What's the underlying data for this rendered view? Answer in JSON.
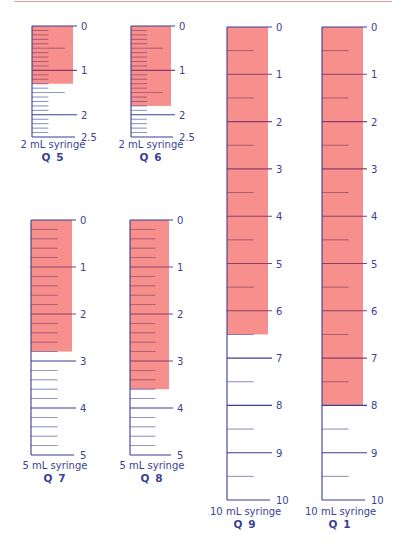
{
  "colors": {
    "scale_line": "#3a3f93",
    "fill": "#f7908d",
    "fill_tick": "#8a3f6a",
    "top_rule": "#e79aa3"
  },
  "syringes": [
    {
      "id": "q5",
      "type_label": "2 mL syringe",
      "question_label": "Q 5",
      "capacity_ml": 2.5,
      "minor_step_ml": 0.1,
      "mid_step_ml": 0.5,
      "major_labels": [
        "0",
        "1",
        "2",
        "2.5"
      ],
      "major_values": [
        0,
        1,
        2,
        2.5
      ],
      "fill_ml": 1.3
    },
    {
      "id": "q6",
      "type_label": "2 mL syringe",
      "question_label": "Q 6",
      "capacity_ml": 2.5,
      "minor_step_ml": 0.1,
      "mid_step_ml": 0.5,
      "major_labels": [
        "0",
        "1",
        "2",
        "2.5"
      ],
      "major_values": [
        0,
        1,
        2,
        2.5
      ],
      "fill_ml": 1.8
    },
    {
      "id": "q7",
      "type_label": "5 mL syringe",
      "question_label": "Q 7",
      "capacity_ml": 5,
      "minor_step_ml": 0.2,
      "mid_step_ml": null,
      "major_labels": [
        "0",
        "1",
        "2",
        "3",
        "4",
        "5"
      ],
      "major_values": [
        0,
        1,
        2,
        3,
        4,
        5
      ],
      "fill_ml": 2.8
    },
    {
      "id": "q8",
      "type_label": "5 mL syringe",
      "question_label": "Q 8",
      "capacity_ml": 5,
      "minor_step_ml": 0.2,
      "mid_step_ml": null,
      "major_labels": [
        "0",
        "1",
        "2",
        "3",
        "4",
        "5"
      ],
      "major_values": [
        0,
        1,
        2,
        3,
        4,
        5
      ],
      "fill_ml": 3.6
    },
    {
      "id": "q9",
      "type_label": "10 mL syringe",
      "question_label": "Q 9",
      "capacity_ml": 10,
      "minor_step_ml": 0.5,
      "mid_step_ml": null,
      "major_labels": [
        "0",
        "1",
        "2",
        "3",
        "4",
        "5",
        "6",
        "7",
        "8",
        "9",
        "10"
      ],
      "major_values": [
        0,
        1,
        2,
        3,
        4,
        5,
        6,
        7,
        8,
        9,
        10
      ],
      "fill_ml": 6.5
    },
    {
      "id": "q1",
      "type_label": "10 mL syringe",
      "question_label": "Q 1",
      "capacity_ml": 10,
      "minor_step_ml": 0.5,
      "mid_step_ml": null,
      "major_labels": [
        "0",
        "1",
        "2",
        "3",
        "4",
        "5",
        "6",
        "7",
        "8",
        "9",
        "10"
      ],
      "major_values": [
        0,
        1,
        2,
        3,
        4,
        5,
        6,
        7,
        8,
        9,
        10
      ],
      "fill_ml": 8
    }
  ]
}
